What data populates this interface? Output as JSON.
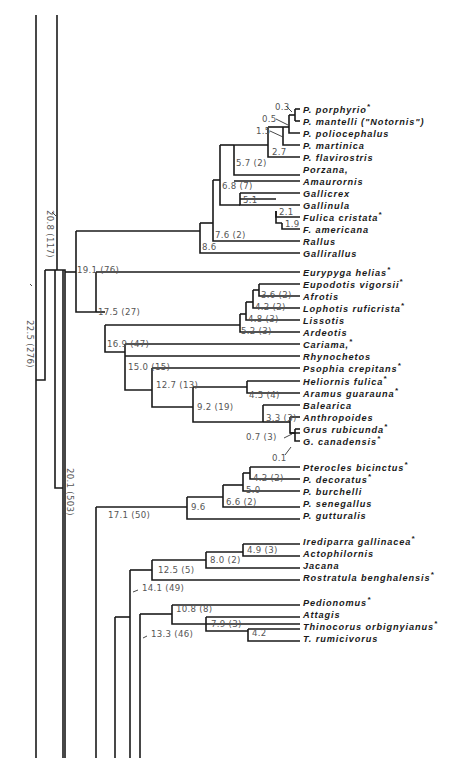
{
  "diagram": {
    "type": "phylogenetic-tree",
    "leaves": [
      {
        "id": "porphyrio",
        "label": "P. porphyrio",
        "star": true,
        "y": 109
      },
      {
        "id": "mantelli",
        "label": "P. mantelli (\"Notornis\")",
        "star": false,
        "y": 121
      },
      {
        "id": "poliocephalus",
        "label": "P. poliocephalus",
        "star": false,
        "y": 133
      },
      {
        "id": "martinica",
        "label": "P. martinica",
        "star": false,
        "y": 145
      },
      {
        "id": "flavirostris",
        "label": "P. flavirostris",
        "star": false,
        "y": 157
      },
      {
        "id": "porzana",
        "label": "Porzana,",
        "star": false,
        "y": 169
      },
      {
        "id": "amaurornis",
        "label": "Amaurornis",
        "star": false,
        "y": 181
      },
      {
        "id": "gallicrex",
        "label": "Gallicrex",
        "star": false,
        "y": 193
      },
      {
        "id": "gallinula",
        "label": "Gallinula",
        "star": false,
        "y": 205
      },
      {
        "id": "fulica",
        "label": "Fulica cristata",
        "star": true,
        "y": 217
      },
      {
        "id": "americana",
        "label": "F. americana",
        "star": false,
        "y": 229
      },
      {
        "id": "rallus",
        "label": "Rallus",
        "star": false,
        "y": 241
      },
      {
        "id": "gallirallus",
        "label": "Gallirallus",
        "star": false,
        "y": 253
      },
      {
        "id": "eurypyga",
        "label": "Eurypyga helias",
        "star": true,
        "y": 272
      },
      {
        "id": "eupodotis",
        "label": "Eupodotis vigorsii",
        "star": true,
        "y": 284
      },
      {
        "id": "afrotis",
        "label": "Afrotis",
        "star": false,
        "y": 296
      },
      {
        "id": "lophotis",
        "label": "Lophotis ruficrista",
        "star": true,
        "y": 308
      },
      {
        "id": "lissotis",
        "label": "Lissotis",
        "star": false,
        "y": 320
      },
      {
        "id": "ardeotis",
        "label": "Ardeotis",
        "star": false,
        "y": 332
      },
      {
        "id": "cariama",
        "label": "Cariama,",
        "star": true,
        "y": 344
      },
      {
        "id": "rhynochetos",
        "label": "Rhynochetos",
        "star": false,
        "y": 356
      },
      {
        "id": "psophia",
        "label": "Psophia crepitans",
        "star": true,
        "y": 368
      },
      {
        "id": "heliornis",
        "label": "Heliornis fulica",
        "star": true,
        "y": 381
      },
      {
        "id": "aramus",
        "label": "Aramus guarauna",
        "star": true,
        "y": 393
      },
      {
        "id": "balearica",
        "label": "Balearica",
        "star": false,
        "y": 405
      },
      {
        "id": "anthropoides",
        "label": "Anthropoides",
        "star": false,
        "y": 417
      },
      {
        "id": "grus",
        "label": "Grus rubicunda",
        "star": true,
        "y": 429
      },
      {
        "id": "canadensis",
        "label": "G. canadensis",
        "star": true,
        "y": 441
      },
      {
        "id": "pterocles",
        "label": "Pterocles bicinctus",
        "star": true,
        "y": 467
      },
      {
        "id": "decoratus",
        "label": "P. decoratus",
        "star": true,
        "y": 479
      },
      {
        "id": "burchelli",
        "label": "P. burchelli",
        "star": false,
        "y": 491
      },
      {
        "id": "senegallus",
        "label": "P. senegallus",
        "star": false,
        "y": 503
      },
      {
        "id": "gutturalis",
        "label": "P. gutturalis",
        "star": false,
        "y": 515
      },
      {
        "id": "irediparra",
        "label": "Irediparra gallinacea",
        "star": true,
        "y": 541
      },
      {
        "id": "actophilornis",
        "label": "Actophilornis",
        "star": false,
        "y": 553
      },
      {
        "id": "jacana",
        "label": "Jacana",
        "star": false,
        "y": 565
      },
      {
        "id": "rostratula",
        "label": "Rostratula benghalensis",
        "star": true,
        "y": 577
      },
      {
        "id": "pedionomus",
        "label": "Pedionomus",
        "star": true,
        "y": 602
      },
      {
        "id": "attagis",
        "label": "Attagis",
        "star": false,
        "y": 614
      },
      {
        "id": "thinocorus",
        "label": "Thinocorus orbignyianus",
        "star": true,
        "y": 626
      },
      {
        "id": "rumicivorus",
        "label": "T. rumicivorus",
        "star": false,
        "y": 638
      }
    ],
    "node_labels": [
      {
        "text": "0.3",
        "x": 275,
        "y": 110
      },
      {
        "text": "0.5",
        "x": 262,
        "y": 122
      },
      {
        "text": "1.5",
        "x": 256,
        "y": 134
      },
      {
        "text": "2.7",
        "x": 272,
        "y": 155
      },
      {
        "text": "5.7 (2)",
        "x": 236,
        "y": 166
      },
      {
        "text": "6.8 (7)",
        "x": 222,
        "y": 189
      },
      {
        "text": "5.1",
        "x": 243,
        "y": 203
      },
      {
        "text": "2.1",
        "x": 279,
        "y": 215
      },
      {
        "text": "1.9",
        "x": 285,
        "y": 227
      },
      {
        "text": "7.6 (2)",
        "x": 215,
        "y": 238
      },
      {
        "text": "8.6",
        "x": 202,
        "y": 250
      },
      {
        "text": "19.1 (76)",
        "x": 77,
        "y": 273
      },
      {
        "text": "17.5 (27)",
        "x": 98,
        "y": 315
      },
      {
        "text": "3.6 (2)",
        "x": 261,
        "y": 298
      },
      {
        "text": "4.2 (2)",
        "x": 255,
        "y": 310
      },
      {
        "text": "4.8 (3)",
        "x": 248,
        "y": 322
      },
      {
        "text": "5.2 (3)",
        "x": 241,
        "y": 334
      },
      {
        "text": "16.9 (47)",
        "x": 107,
        "y": 347
      },
      {
        "text": "15.0 (15)",
        "x": 128,
        "y": 370
      },
      {
        "text": "12.7 (13)",
        "x": 156,
        "y": 388
      },
      {
        "text": "4.5 (4)",
        "x": 249,
        "y": 398
      },
      {
        "text": "9.2 (19)",
        "x": 197,
        "y": 410
      },
      {
        "text": "3.3 (3)",
        "x": 266,
        "y": 421
      },
      {
        "text": "0.7 (3)",
        "x": 246,
        "y": 440
      },
      {
        "text": "0.1",
        "x": 272,
        "y": 461
      },
      {
        "text": "4.2 (2)",
        "x": 253,
        "y": 481
      },
      {
        "text": "5.0",
        "x": 246,
        "y": 493
      },
      {
        "text": "6.6 (2)",
        "x": 226,
        "y": 505
      },
      {
        "text": "9.6",
        "x": 191,
        "y": 510
      },
      {
        "text": "17.1 (50)",
        "x": 108,
        "y": 518
      },
      {
        "text": "4.9 (3)",
        "x": 247,
        "y": 553
      },
      {
        "text": "8.0 (2)",
        "x": 210,
        "y": 563
      },
      {
        "text": "12.5 (5)",
        "x": 158,
        "y": 573
      },
      {
        "text": "14.1 (49)",
        "x": 142,
        "y": 591
      },
      {
        "text": "10.8 (8)",
        "x": 176,
        "y": 612
      },
      {
        "text": "7.9 (3)",
        "x": 211,
        "y": 627
      },
      {
        "text": "4.2",
        "x": 252,
        "y": 636
      },
      {
        "text": "13.3 (46)",
        "x": 151,
        "y": 637
      }
    ],
    "rotated_labels": [
      {
        "text": "20.8 (117)",
        "x": 47,
        "y": 210
      },
      {
        "text": "22.5 (276)",
        "x": 27,
        "y": 320
      },
      {
        "text": "20.1 (503)",
        "x": 67,
        "y": 468
      }
    ],
    "asterisk": "*"
  }
}
